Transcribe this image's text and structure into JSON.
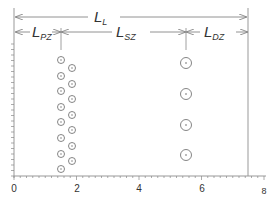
{
  "diagram": {
    "labels": {
      "L_L": {
        "main": "L",
        "sub": "L"
      },
      "L_PZ": {
        "main": "L",
        "sub": "PZ"
      },
      "L_SZ": {
        "main": "L",
        "sub": "SZ"
      },
      "L_DZ": {
        "main": "L",
        "sub": "DZ"
      }
    },
    "x_axis": {
      "ticks": [
        "0",
        "2",
        "4",
        "6",
        "8"
      ],
      "range": [
        0,
        8
      ]
    },
    "boundaries_x": {
      "left": 0,
      "pz_sz": 1.5,
      "sz_dz": 5.5,
      "right": 7.45
    },
    "columns": [
      {
        "name": "column-1",
        "x": 1.5,
        "count": 9
      },
      {
        "name": "column-2",
        "x": 1.85,
        "count": 8
      },
      {
        "name": "column-3",
        "x": 5.5,
        "count": 4
      }
    ],
    "colors": {
      "line": "#777777",
      "circle": "#666666",
      "text": "#333333"
    }
  }
}
